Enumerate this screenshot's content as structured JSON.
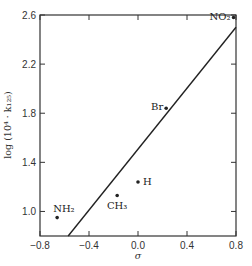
{
  "chart_data": {
    "type": "scatter",
    "title": "",
    "xlabel": "σ",
    "ylabel": "log (10⁴ · k₁₂₅)",
    "xlim": [
      -0.8,
      0.8
    ],
    "ylim": [
      0.8,
      2.6
    ],
    "xticks": [
      -0.8,
      -0.4,
      0.0,
      0.4,
      0.8
    ],
    "xtick_labels": [
      "−0.8",
      "−0.4",
      "0.0",
      "0.4",
      "0.8"
    ],
    "yticks": [
      1.0,
      1.4,
      1.8,
      2.2,
      2.6
    ],
    "ytick_labels": [
      "1.0",
      "1.4",
      "1.8",
      "2.2",
      "2.6"
    ],
    "grid": false,
    "legend": null,
    "points": [
      {
        "label": "NO₂",
        "x": 0.78,
        "y": 2.58
      },
      {
        "label": "Br",
        "x": 0.23,
        "y": 1.84
      },
      {
        "label": "H",
        "x": 0.0,
        "y": 1.24
      },
      {
        "label": "CH₃",
        "x": -0.17,
        "y": 1.13
      },
      {
        "label": "NH₂",
        "x": -0.66,
        "y": 0.95
      }
    ],
    "fit_line": {
      "x": [
        -0.57,
        0.8
      ],
      "y": [
        0.8,
        2.5
      ]
    }
  }
}
